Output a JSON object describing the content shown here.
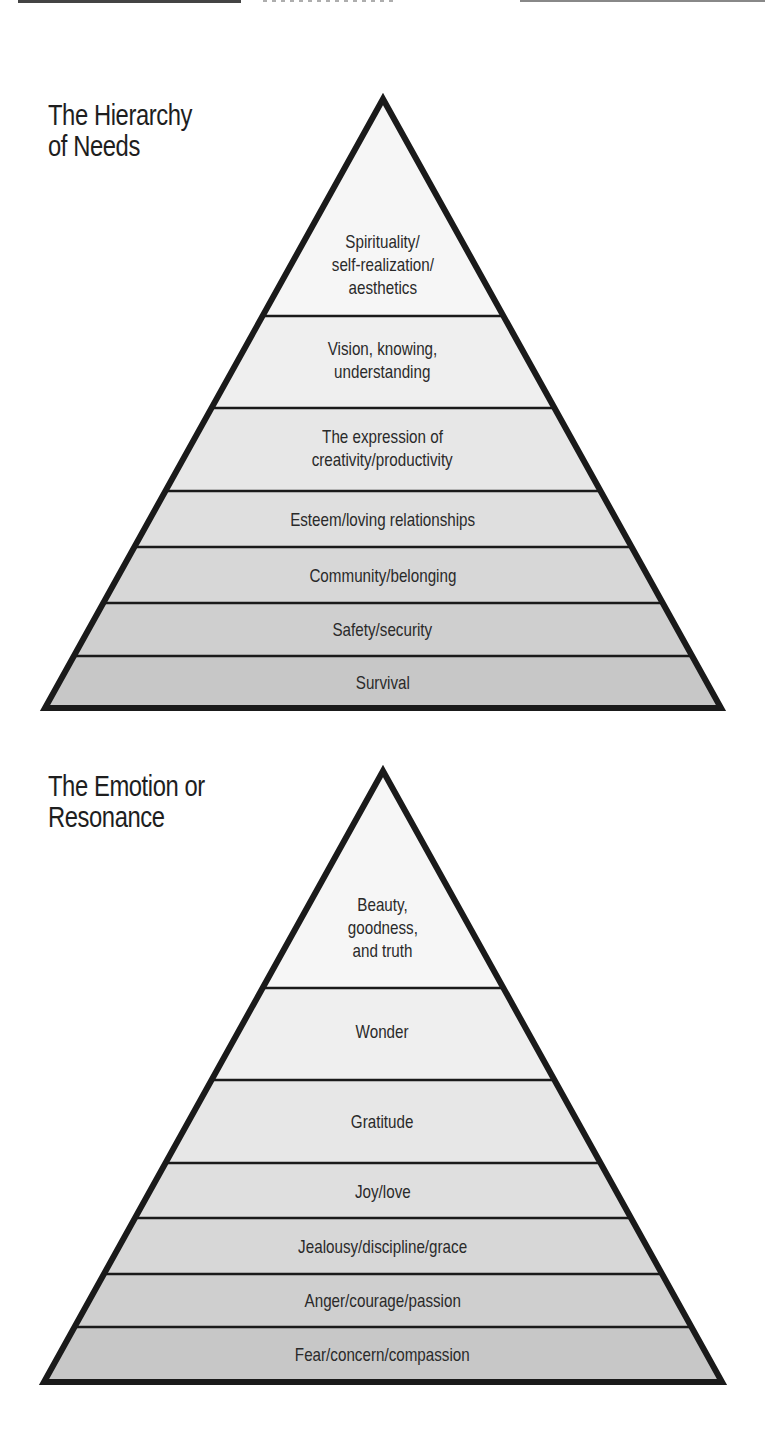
{
  "colors": {
    "outline": "#1a1a1a",
    "band_fills": [
      "#f5f5f5",
      "#eeeeee",
      "#e6e6e6",
      "#dedede",
      "#d6d6d6",
      "#cecece",
      "#c6c6c6"
    ]
  },
  "pyramids": [
    {
      "title_line1": "The Hierarchy",
      "title_line2": "of Needs",
      "bands": [
        {
          "line1": "Spirituality/",
          "line2": "self-realization/",
          "line3": "aesthetics"
        },
        {
          "line1": "Vision, knowing,",
          "line2": "understanding"
        },
        {
          "line1": "The expression of",
          "line2": "creativity/productivity"
        },
        {
          "line1": "Esteem/loving relationships"
        },
        {
          "line1": "Community/belonging"
        },
        {
          "line1": "Safety/security"
        },
        {
          "line1": "Survival"
        }
      ]
    },
    {
      "title_line1": "The Emotion or",
      "title_line2": "Resonance",
      "bands": [
        {
          "line1": "Beauty,",
          "line2": "goodness,",
          "line3": "and truth"
        },
        {
          "line1": "Wonder"
        },
        {
          "line1": "Gratitude"
        },
        {
          "line1": "Joy/love"
        },
        {
          "line1": "Jealousy/discipline/grace"
        },
        {
          "line1": "Anger/courage/passion"
        },
        {
          "line1": "Fear/concern/compassion"
        }
      ]
    }
  ]
}
